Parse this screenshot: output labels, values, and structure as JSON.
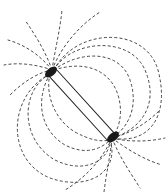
{
  "figure": {
    "colors": {
      "background": "#ffffff",
      "filings": "#333333",
      "magnet_outline": "#222222",
      "pole_cluster": "#1a1a1a"
    },
    "magnet": {
      "end_a": [
        52,
        72
      ],
      "end_b": [
        112,
        138
      ],
      "width_px": 10
    }
  }
}
